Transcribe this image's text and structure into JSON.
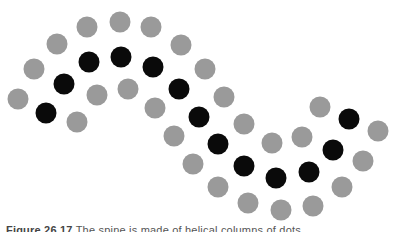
{
  "figure": {
    "colors": {
      "gray": "#9a9a9a",
      "black": "#0a0a0a",
      "background": "#ffffff"
    },
    "dot_radius": 10,
    "dots": [
      {
        "x": 18,
        "y": 99,
        "c": "gray"
      },
      {
        "x": 34,
        "y": 69,
        "c": "gray"
      },
      {
        "x": 57,
        "y": 44,
        "c": "gray"
      },
      {
        "x": 87,
        "y": 27,
        "c": "gray"
      },
      {
        "x": 120,
        "y": 22,
        "c": "gray"
      },
      {
        "x": 151,
        "y": 27,
        "c": "gray"
      },
      {
        "x": 181,
        "y": 45,
        "c": "gray"
      },
      {
        "x": 205,
        "y": 69,
        "c": "gray"
      },
      {
        "x": 224,
        "y": 97,
        "c": "gray"
      },
      {
        "x": 244,
        "y": 124,
        "c": "gray"
      },
      {
        "x": 272,
        "y": 143,
        "c": "gray"
      },
      {
        "x": 302,
        "y": 137,
        "c": "gray"
      },
      {
        "x": 320,
        "y": 107,
        "c": "gray"
      },
      {
        "x": 378,
        "y": 131,
        "c": "gray"
      },
      {
        "x": 363,
        "y": 161,
        "c": "gray"
      },
      {
        "x": 342,
        "y": 187,
        "c": "gray"
      },
      {
        "x": 313,
        "y": 206,
        "c": "gray"
      },
      {
        "x": 281,
        "y": 210,
        "c": "gray"
      },
      {
        "x": 248,
        "y": 203,
        "c": "gray"
      },
      {
        "x": 218,
        "y": 187,
        "c": "gray"
      },
      {
        "x": 193,
        "y": 164,
        "c": "gray"
      },
      {
        "x": 174,
        "y": 136,
        "c": "gray"
      },
      {
        "x": 155,
        "y": 108,
        "c": "gray"
      },
      {
        "x": 128,
        "y": 89,
        "c": "gray"
      },
      {
        "x": 97,
        "y": 95,
        "c": "gray"
      },
      {
        "x": 77,
        "y": 122,
        "c": "gray"
      },
      {
        "x": 46,
        "y": 113,
        "c": "black"
      },
      {
        "x": 64,
        "y": 84,
        "c": "black"
      },
      {
        "x": 89,
        "y": 62,
        "c": "black"
      },
      {
        "x": 121,
        "y": 57,
        "c": "black"
      },
      {
        "x": 153,
        "y": 67,
        "c": "black"
      },
      {
        "x": 179,
        "y": 89,
        "c": "black"
      },
      {
        "x": 199,
        "y": 117,
        "c": "black"
      },
      {
        "x": 218,
        "y": 144,
        "c": "black"
      },
      {
        "x": 244,
        "y": 166,
        "c": "black"
      },
      {
        "x": 276,
        "y": 178,
        "c": "black"
      },
      {
        "x": 309,
        "y": 172,
        "c": "black"
      },
      {
        "x": 333,
        "y": 150,
        "c": "black"
      },
      {
        "x": 349,
        "y": 119,
        "c": "black"
      }
    ]
  },
  "caption": {
    "label": "Figure 26.17",
    "text": "The spine is made of helical columns of dots."
  }
}
